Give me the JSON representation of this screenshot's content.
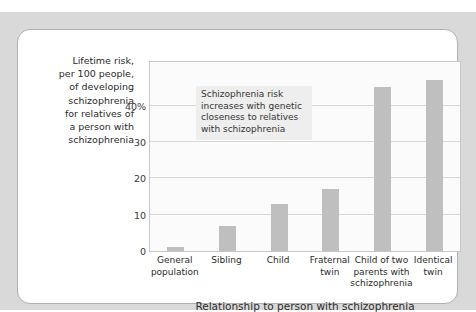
{
  "top_caption": {
    "clipped_text": "Figure (clipped caption text, partly cut off)"
  },
  "chart_data": {
    "type": "bar",
    "title": "",
    "categories": [
      "General population",
      "Sibling",
      "Child",
      "Fraternal twin",
      "Child of two parents with schizophrenia",
      "Identical twin"
    ],
    "values": [
      1,
      7,
      13,
      17,
      45,
      47
    ],
    "xlabel": "Relationship to person with schizophrenia",
    "ylabel": "Lifetime risk, per 100 people, of developing schizophrenia for relatives of a person with schizophrenia",
    "ylim": [
      0,
      52
    ],
    "yticks": [
      0,
      10,
      20,
      30,
      40
    ],
    "ytick_labels": [
      "0",
      "10",
      "20",
      "30",
      "40%"
    ],
    "grid": true,
    "legend": "none",
    "bar_color": "#bfbfbf",
    "plot_background": "#fbfbfb",
    "annotations": [
      {
        "text": "Schizophrenia risk increases with genetic closeness to relatives with schizophrenia",
        "background": "#eeeeee"
      }
    ]
  },
  "axis": {
    "y_title_lines": [
      "Lifetime risk,",
      "per 100 people,",
      "of developing",
      "schizophrenia",
      "for relatives of",
      "a person with",
      "schizophrenia"
    ],
    "x_title": "Relationship to person with schizophrenia"
  },
  "categories_wrapped": [
    [
      "General",
      "population"
    ],
    [
      "Sibling"
    ],
    [
      "Child"
    ],
    [
      "Fraternal",
      "twin"
    ],
    [
      "Child of two",
      "parents with",
      "schizophrenia"
    ],
    [
      "Identical",
      "twin"
    ]
  ]
}
